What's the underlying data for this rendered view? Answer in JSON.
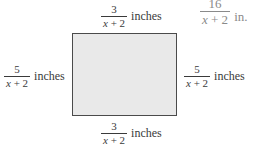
{
  "diagram": {
    "shape": "rectangle",
    "fill_color": "#e9e9e9",
    "border_color": "#4a4a4a",
    "labels": {
      "top": {
        "numerator": "3",
        "variable": "x",
        "rest": " + 2",
        "unit": "inches"
      },
      "bottom": {
        "numerator": "3",
        "variable": "x",
        "rest": " + 2",
        "unit": "inches"
      },
      "left": {
        "numerator": "5",
        "variable": "x",
        "rest": " + 2",
        "unit": "inches"
      },
      "right": {
        "numerator": "5",
        "variable": "x",
        "rest": " + 2",
        "unit": "inches"
      },
      "corner": {
        "numerator": "16",
        "variable": "x",
        "rest": " + 2",
        "unit": "in."
      }
    }
  }
}
